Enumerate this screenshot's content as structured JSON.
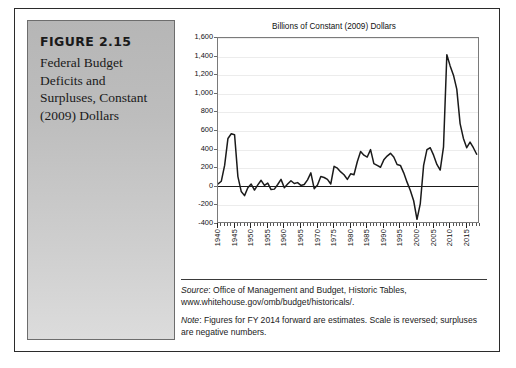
{
  "figure": {
    "number": "FIGURE 2.15",
    "title": "Federal Budget Deficits and Surpluses, Constant (2009) Dollars"
  },
  "notes": {
    "source_lead": "Source",
    "source_text": ": Office of Management and Budget, Historic Tables,",
    "source_url": "www.whitehouse.gov/omb/budget/historicals/.",
    "note_lead": "Note",
    "note_text": ": Figures for FY 2014 forward are estimates. Scale is reversed; surpluses are negative numbers."
  },
  "colors": {
    "panel_top": "#b6b6b6",
    "panel_bottom": "#dcdcdc",
    "line": "#1a1a1a",
    "frame": "#2b2b2b",
    "grid": "#ececec"
  },
  "chart_data": {
    "type": "line",
    "title": "Billions of Constant (2009) Dollars",
    "xlabel": "",
    "ylabel": "",
    "ylim": [
      -400,
      1600
    ],
    "xlim": [
      1940,
      2019
    ],
    "ytick_labels": [
      "1,600",
      "1,400",
      "1,200",
      "1,000",
      "800",
      "600",
      "400",
      "200",
      "0",
      "-200",
      "-400"
    ],
    "ytick_values": [
      1600,
      1400,
      1200,
      1000,
      800,
      600,
      400,
      200,
      0,
      -200,
      -400
    ],
    "xtick_labels": [
      "1940",
      "1945",
      "1950",
      "1955",
      "1960",
      "1965",
      "1970",
      "1975",
      "1980",
      "1985",
      "1990",
      "1995",
      "2000",
      "2005",
      "2010",
      "2015"
    ],
    "xtick_values": [
      1940,
      1945,
      1950,
      1955,
      1960,
      1965,
      1970,
      1975,
      1980,
      1985,
      1990,
      1995,
      2000,
      2005,
      2010,
      2015
    ],
    "grid": true,
    "legend": "none",
    "series": [
      {
        "name": "Federal budget deficit (constant 2009 dollars)",
        "x": [
          1940,
          1941,
          1942,
          1943,
          1944,
          1945,
          1946,
          1947,
          1948,
          1949,
          1950,
          1951,
          1952,
          1953,
          1954,
          1955,
          1956,
          1957,
          1958,
          1959,
          1960,
          1961,
          1962,
          1963,
          1964,
          1965,
          1966,
          1967,
          1968,
          1969,
          1970,
          1971,
          1972,
          1973,
          1974,
          1975,
          1976,
          1977,
          1978,
          1979,
          1980,
          1981,
          1982,
          1983,
          1984,
          1985,
          1986,
          1987,
          1988,
          1989,
          1990,
          1991,
          1992,
          1993,
          1994,
          1995,
          1996,
          1997,
          1998,
          1999,
          2000,
          2001,
          2002,
          2003,
          2004,
          2005,
          2006,
          2007,
          2008,
          2009,
          2010,
          2011,
          2012,
          2013,
          2014,
          2015,
          2016,
          2017,
          2018
        ],
        "values": [
          30,
          60,
          230,
          520,
          570,
          560,
          110,
          -50,
          -95,
          -10,
          30,
          -35,
          20,
          70,
          15,
          40,
          -30,
          -25,
          25,
          80,
          -10,
          30,
          65,
          35,
          45,
          15,
          25,
          75,
          150,
          -20,
          20,
          110,
          100,
          80,
          30,
          220,
          200,
          160,
          130,
          80,
          140,
          130,
          270,
          380,
          340,
          320,
          400,
          250,
          230,
          210,
          290,
          330,
          360,
          320,
          240,
          230,
          150,
          50,
          -40,
          -150,
          -350,
          -180,
          230,
          400,
          420,
          340,
          240,
          180,
          430,
          1420,
          1300,
          1200,
          1050,
          680,
          520,
          420,
          480,
          420,
          350
        ]
      }
    ]
  }
}
